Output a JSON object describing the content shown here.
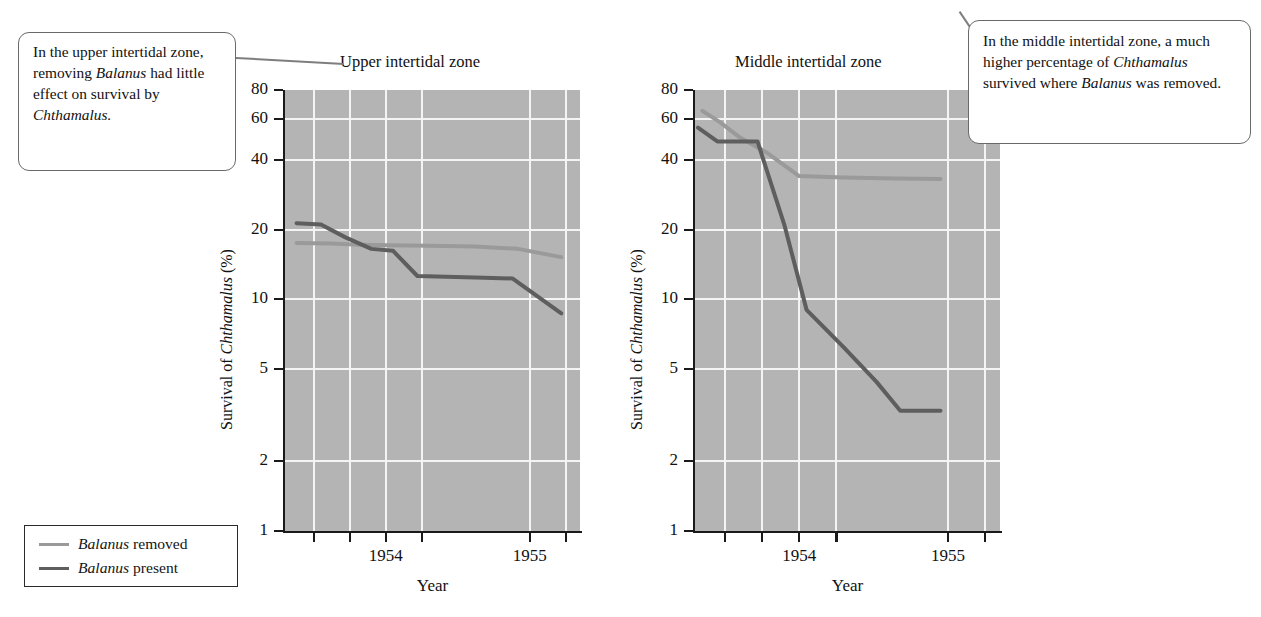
{
  "callouts": {
    "upper": {
      "id": "upper-intertidal-callout",
      "lines": [
        {
          "text": "In the upper intertidal",
          "italic": false
        },
        {
          "text": "zone, removing",
          "italic": false
        },
        {
          "text": "Balanus",
          "italic": true,
          "tail": " had little"
        },
        {
          "text": "effect on survival",
          "italic": false
        },
        {
          "text": "by ",
          "italic": false,
          "em": "Chthamalus."
        }
      ],
      "plain": "In the upper intertidal zone, removing Balanus had little effect on survival by Chthamalus."
    },
    "middle": {
      "id": "middle-intertidal-callout",
      "plain": "In the middle intertidal zone, a much higher percentage of Chthamalus survived where Balanus was removed."
    }
  },
  "legend": {
    "items": [
      {
        "label": "Balanus removed",
        "italic_word": "Balanus",
        "rest": " removed",
        "color": "#9a9a9a"
      },
      {
        "label": "Balanus present",
        "italic_word": "Balanus",
        "rest": " present",
        "color": "#5e5e5e"
      }
    ]
  },
  "axis": {
    "y_label_prefix": "Survival of ",
    "y_label_italic": "Chthamalus",
    "y_label_suffix": " (%)",
    "x_label": "Year",
    "y_ticks": [
      80,
      60,
      40,
      20,
      10,
      5,
      2,
      1
    ],
    "x_ticks": [
      "",
      "",
      "1954",
      "",
      "1955",
      ""
    ]
  },
  "chart_data": [
    {
      "type": "line",
      "title": "Upper intertidal zone",
      "xlabel": "Year",
      "ylabel": "Survival of Chthamalus (%)",
      "yscale": "log",
      "ylim": [
        1,
        80
      ],
      "ytick_values": [
        80,
        60,
        40,
        20,
        10,
        5,
        2,
        1
      ],
      "xlim": [
        1953.3,
        1955.35
      ],
      "xtick_values": [
        1953.5,
        1953.75,
        1954,
        1954.25,
        1955,
        1955.25
      ],
      "xtick_labels": [
        "",
        "",
        "1954",
        "",
        "1955",
        ""
      ],
      "grid": true,
      "legend_position": "outside-lower-left",
      "series": [
        {
          "name": "Balanus removed",
          "color": "#9a9a9a",
          "x": [
            1953.38,
            1953.62,
            1953.82,
            1954.02,
            1954.3,
            1954.62,
            1954.92,
            1955.22
          ],
          "y": [
            17.5,
            17.4,
            17.2,
            17.1,
            17.0,
            16.9,
            16.5,
            15.2
          ]
        },
        {
          "name": "Balanus present",
          "color": "#5e5e5e",
          "x": [
            1953.38,
            1953.55,
            1953.72,
            1953.9,
            1954.05,
            1954.22,
            1954.62,
            1954.88,
            1955.22
          ],
          "y": [
            21.3,
            21.0,
            18.5,
            16.5,
            16.2,
            12.6,
            12.4,
            12.3,
            8.7
          ]
        }
      ]
    },
    {
      "type": "line",
      "title": "Middle intertidal zone",
      "xlabel": "Year",
      "ylabel": "Survival of Chthamalus (%)",
      "yscale": "log",
      "ylim": [
        1,
        80
      ],
      "ytick_values": [
        80,
        60,
        40,
        20,
        10,
        5,
        2,
        1
      ],
      "xlim": [
        1953.3,
        1955.35
      ],
      "xtick_values": [
        1953.5,
        1953.75,
        1954,
        1954.25,
        1955,
        1955.25
      ],
      "xtick_labels": [
        "",
        "",
        "1954",
        "",
        "1955",
        ""
      ],
      "grid": true,
      "legend_position": "outside-lower-left",
      "series": [
        {
          "name": "Balanus removed",
          "color": "#9a9a9a",
          "x": [
            1953.35,
            1953.47,
            1953.6,
            1953.78,
            1954.0,
            1954.3,
            1954.65,
            1954.95
          ],
          "y": [
            65,
            58,
            50,
            43,
            34,
            33.5,
            33.2,
            33.0
          ]
        },
        {
          "name": "Balanus present",
          "color": "#5e5e5e",
          "x": [
            1953.32,
            1953.45,
            1953.58,
            1953.72,
            1953.9,
            1954.05,
            1954.3,
            1954.52,
            1954.68,
            1954.95
          ],
          "y": [
            55,
            48,
            48,
            48,
            21,
            9.0,
            6.2,
            4.4,
            3.3,
            3.3
          ]
        }
      ]
    }
  ]
}
